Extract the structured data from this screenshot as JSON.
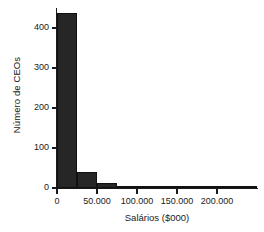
{
  "chart_data": {
    "type": "bar",
    "title": "",
    "subtitle": "",
    "xlabel": "Salários ($000)",
    "ylabel": "Número de CEOs",
    "bin_width": 25000,
    "xlim": [
      0,
      250000
    ],
    "ylim": [
      0,
      450
    ],
    "grid": false,
    "legend": "none",
    "xticks": [
      {
        "value": 0,
        "label": "0"
      },
      {
        "value": 50000,
        "label": "50.000"
      },
      {
        "value": 100000,
        "label": "100.000"
      },
      {
        "value": 150000,
        "label": "150.000"
      },
      {
        "value": 200000,
        "label": "200.000"
      }
    ],
    "yticks": [
      {
        "value": 0,
        "label": "0"
      },
      {
        "value": 100,
        "label": "100"
      },
      {
        "value": 200,
        "label": "200"
      },
      {
        "value": 300,
        "label": "300"
      },
      {
        "value": 400,
        "label": "400"
      }
    ],
    "bars": [
      {
        "bin_start": 0,
        "bin_end": 25000,
        "value": 437
      },
      {
        "bin_start": 25000,
        "bin_end": 50000,
        "value": 40
      },
      {
        "bin_start": 50000,
        "bin_end": 75000,
        "value": 12
      },
      {
        "bin_start": 75000,
        "bin_end": 100000,
        "value": 3
      },
      {
        "bin_start": 100000,
        "bin_end": 125000,
        "value": 1
      },
      {
        "bin_start": 125000,
        "bin_end": 150000,
        "value": 1
      },
      {
        "bin_start": 150000,
        "bin_end": 175000,
        "value": 0
      },
      {
        "bin_start": 175000,
        "bin_end": 200000,
        "value": 0
      },
      {
        "bin_start": 200000,
        "bin_end": 225000,
        "value": 0
      },
      {
        "bin_start": 225000,
        "bin_end": 250000,
        "value": 2
      }
    ],
    "categories": [
      "0-25.000",
      "25.000-50.000",
      "50.000-75.000",
      "75.000-100.000",
      "100.000-125.000",
      "125.000-150.000",
      "150.000-175.000",
      "175.000-200.000",
      "200.000-225.000",
      "225.000-250.000"
    ],
    "values": [
      437,
      40,
      12,
      3,
      1,
      1,
      0,
      0,
      0,
      2
    ],
    "colors": {
      "bar_fill": "#262626",
      "bar_edge": "#111111",
      "axis": "#1a1a1a",
      "background": "#ffffff",
      "text": "#1a1a1a"
    }
  }
}
